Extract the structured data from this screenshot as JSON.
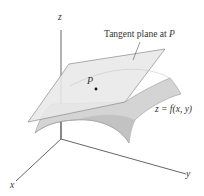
{
  "figure": {
    "tangent_plane_label": {
      "text": "Tangent plane at ",
      "var": "P"
    },
    "surface_label": "z = f(x, y)",
    "point_label": "P",
    "axes": {
      "x": "x",
      "y": "y",
      "z": "z"
    }
  },
  "colors": {
    "axis": "#555555",
    "plane_fill": "#e6e6e6",
    "plane_edge": "#8a8a8a",
    "surface_fill": "#d2d2d2",
    "surface_shade": "#bdbdbd",
    "point": "#111111"
  }
}
